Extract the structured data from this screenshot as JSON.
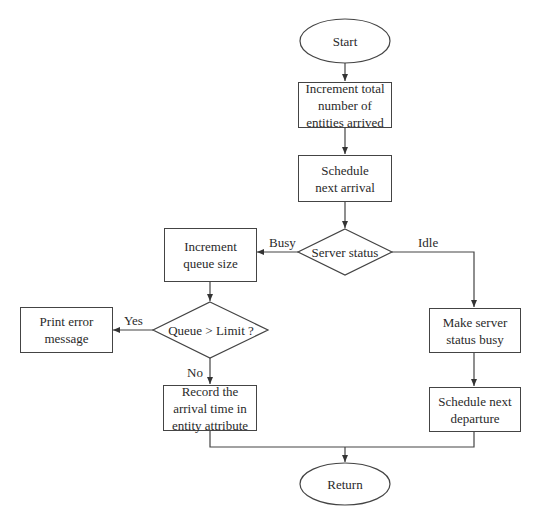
{
  "diagram": {
    "type": "flowchart",
    "colors": {
      "stroke": "#444444",
      "text": "#2a2a2a",
      "background": "#ffffff"
    },
    "nodes": {
      "start": "Start",
      "increment_total": "Increment total number of entities arrived",
      "schedule_arrival": "Schedule next arrival",
      "server_status": "Server status",
      "increment_queue": "Increment queue size",
      "queue_check": "Queue > Limit ?",
      "print_error": "Print error message",
      "record_time": "Record the arrival time in entity attribute",
      "make_busy": "Make server status busy",
      "schedule_departure": "Schedule next departure",
      "return": "Return"
    },
    "edge_labels": {
      "busy": "Busy",
      "idle": "Idle",
      "yes": "Yes",
      "no": "No"
    }
  }
}
